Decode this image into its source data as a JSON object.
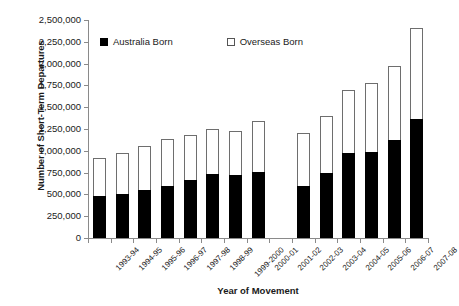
{
  "chart_data": {
    "type": "bar",
    "title": "",
    "xlabel": "Year of Movement",
    "ylabel": "Number of Short-Term Departures",
    "stacked": true,
    "grid": false,
    "legend_position": "top-inside",
    "ylim": [
      0,
      2500000
    ],
    "ytick_step": 250000,
    "ytick_labels": [
      "2,500,000",
      "2,250,000",
      "2,000,000",
      "1,750,000",
      "1,500,000",
      "1,250,000",
      "1,000,000",
      "750,000",
      "500,000",
      "250,000",
      "0"
    ],
    "ytick_values": [
      2500000,
      2250000,
      2000000,
      1750000,
      1500000,
      1250000,
      1000000,
      750000,
      500000,
      250000,
      0
    ],
    "categories": [
      "1993-94",
      "1994-95",
      "1995-96",
      "1996-97",
      "1997-98",
      "1998-99",
      "1999-2000",
      "2000-01",
      "2001-02",
      "2002-03",
      "2003-04",
      "2004-05",
      "2005-06",
      "2006-07",
      "2007-08"
    ],
    "series": [
      {
        "name": "Australia  Born",
        "color": "#000000",
        "values": [
          480000,
          500000,
          545000,
          600000,
          665000,
          730000,
          720000,
          755000,
          null,
          600000,
          750000,
          980000,
          990000,
          1120000,
          1370000
        ]
      },
      {
        "name": "Overseas Born",
        "color": "#ffffff",
        "values": [
          440000,
          470000,
          505000,
          530000,
          515000,
          520000,
          510000,
          585000,
          null,
          600000,
          650000,
          720000,
          790000,
          850000,
          1040000
        ]
      }
    ],
    "totals": [
      920000,
      970000,
      1050000,
      1130000,
      1180000,
      1250000,
      1230000,
      1340000,
      null,
      1200000,
      1400000,
      1700000,
      1780000,
      1970000,
      2410000
    ]
  },
  "legend": {
    "entries": [
      {
        "label": "Australia  Born",
        "marker": "filled-square"
      },
      {
        "label": "Overseas Born",
        "marker": "hollow-square"
      }
    ]
  }
}
